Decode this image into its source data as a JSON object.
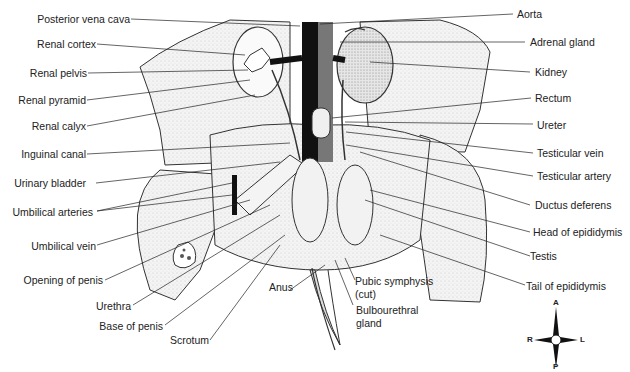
{
  "diagram": {
    "labels_left": [
      "Posterior vena cava",
      "Renal cortex",
      "Renal pelvis",
      "Renal pyramid",
      "Renal calyx",
      "Inguinal canal",
      "Urinary bladder",
      "Umbilical arteries",
      "Umbilical vein",
      "Opening of penis",
      "Urethra",
      "Base of penis",
      "Scrotum"
    ],
    "labels_right": [
      "Aorta",
      "Adrenal gland",
      "Kidney",
      "Rectum",
      "Ureter",
      "Testicular vein",
      "Testicular artery",
      "Ductus deferens",
      "Head of epididymis",
      "Testis",
      "Tail of epididymis"
    ],
    "labels_bottom": {
      "anus": "Anus",
      "pubic_symphysis_line1": "Pubic symphysis",
      "pubic_symphysis_line2": "(cut)",
      "bulbourethral_line1": "Bulbourethral",
      "bulbourethral_line2": "gland"
    },
    "compass": {
      "anterior": "A",
      "posterior": "P",
      "right": "R",
      "left": "L"
    }
  }
}
